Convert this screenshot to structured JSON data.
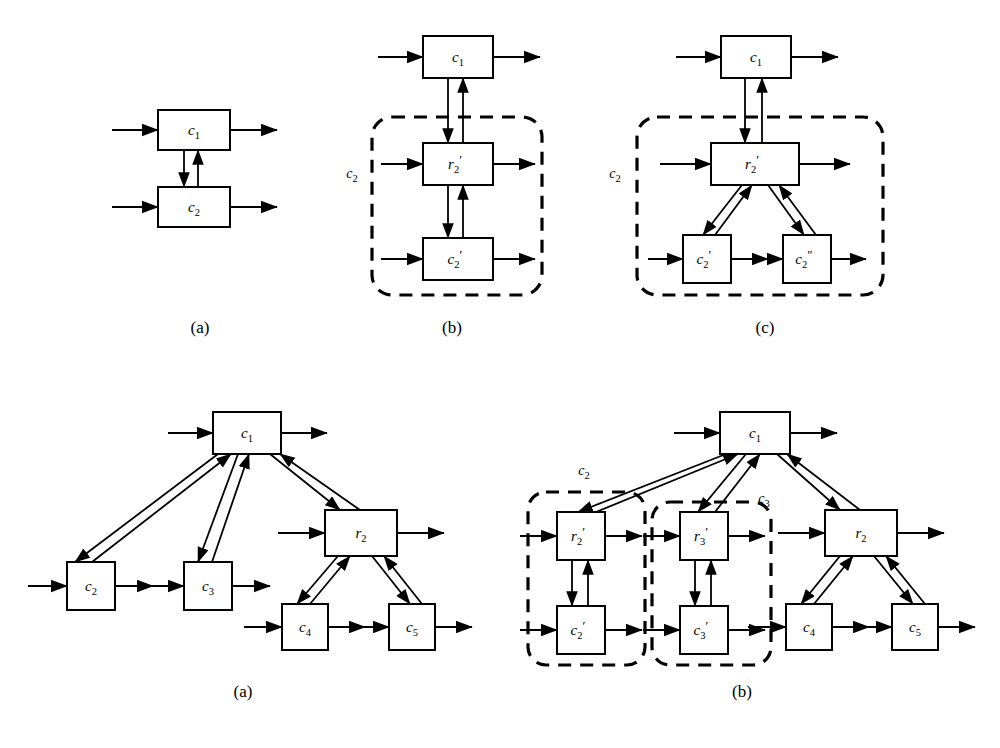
{
  "figure": {
    "background": "#ffffff",
    "ink": "#000000",
    "panels": [
      {
        "id": "top-a",
        "caption": "(a)",
        "caption_xy": [
          200,
          333
        ],
        "group_labels": [],
        "boxes": [
          {
            "name": "c1",
            "base": "c",
            "sub": "1",
            "prime": "",
            "x": 158,
            "y": 110,
            "w": 72,
            "h": 40
          },
          {
            "name": "c2",
            "base": "c",
            "sub": "2",
            "prime": "",
            "x": 158,
            "y": 187,
            "w": 72,
            "h": 40
          }
        ],
        "io_arrows": [
          {
            "kind": "in",
            "y": 130,
            "x1": 112,
            "x2": 158
          },
          {
            "kind": "out",
            "y": 130,
            "x1": 230,
            "x2": 277
          },
          {
            "kind": "in",
            "y": 207,
            "x1": 112,
            "x2": 158
          },
          {
            "kind": "out",
            "y": 207,
            "x1": 230,
            "x2": 277
          }
        ],
        "links": [
          {
            "from": "c1",
            "to": "c2",
            "x": 184,
            "y1": 150,
            "y2": 187,
            "dir": "down"
          },
          {
            "from": "c2",
            "to": "c1",
            "x": 198,
            "y1": 187,
            "y2": 150,
            "dir": "up"
          }
        ]
      },
      {
        "id": "top-b",
        "caption": "(b)",
        "caption_xy": [
          452,
          333
        ],
        "group_labels": [
          {
            "base": "c",
            "sub": "2",
            "prime": "",
            "x": 352,
            "y": 178
          }
        ],
        "dashed_boxes": [
          {
            "x": 372,
            "y": 117,
            "w": 170,
            "h": 178,
            "r": 20
          }
        ],
        "boxes": [
          {
            "name": "c1",
            "base": "c",
            "sub": "1",
            "prime": "",
            "x": 423,
            "y": 36,
            "w": 70,
            "h": 42
          },
          {
            "name": "r2p",
            "base": "r",
            "sub": "2",
            "prime": "′",
            "x": 423,
            "y": 143,
            "w": 70,
            "h": 42
          },
          {
            "name": "c2p",
            "base": "c",
            "sub": "2",
            "prime": "′",
            "x": 423,
            "y": 238,
            "w": 70,
            "h": 42
          }
        ],
        "io_arrows": [
          {
            "kind": "in",
            "y": 57,
            "x1": 378,
            "x2": 423
          },
          {
            "kind": "out",
            "y": 57,
            "x1": 493,
            "x2": 540
          },
          {
            "kind": "in",
            "y": 164,
            "x1": 381,
            "x2": 423
          },
          {
            "kind": "out",
            "y": 164,
            "x1": 493,
            "x2": 535
          },
          {
            "kind": "in",
            "y": 259,
            "x1": 381,
            "x2": 423
          },
          {
            "kind": "out",
            "y": 259,
            "x1": 493,
            "x2": 535
          }
        ],
        "links": [
          {
            "from": "c1",
            "to": "r2p",
            "x": 448,
            "y1": 78,
            "y2": 143,
            "dir": "down"
          },
          {
            "from": "r2p",
            "to": "c1",
            "x": 463,
            "y1": 143,
            "y2": 78,
            "dir": "up"
          },
          {
            "from": "r2p",
            "to": "c2p",
            "x": 448,
            "y1": 185,
            "y2": 238,
            "dir": "down"
          },
          {
            "from": "c2p",
            "to": "r2p",
            "x": 463,
            "y1": 238,
            "y2": 185,
            "dir": "up"
          }
        ]
      },
      {
        "id": "top-c",
        "caption": "(c)",
        "caption_xy": [
          765,
          333
        ],
        "group_labels": [
          {
            "base": "c",
            "sub": "2",
            "prime": "",
            "x": 615,
            "y": 178
          }
        ],
        "dashed_boxes": [
          {
            "x": 637,
            "y": 117,
            "w": 246,
            "h": 178,
            "r": 20
          }
        ],
        "boxes": [
          {
            "name": "c1",
            "base": "c",
            "sub": "1",
            "prime": "",
            "x": 721,
            "y": 36,
            "w": 70,
            "h": 42
          },
          {
            "name": "r2p",
            "base": "r",
            "sub": "2",
            "prime": "′",
            "x": 711,
            "y": 143,
            "w": 88,
            "h": 42
          },
          {
            "name": "c2p",
            "base": "c",
            "sub": "2",
            "prime": "′",
            "x": 683,
            "y": 235,
            "w": 48,
            "h": 48
          },
          {
            "name": "c2pp",
            "base": "c",
            "sub": "2",
            "prime": "″",
            "x": 783,
            "y": 235,
            "w": 48,
            "h": 48
          }
        ],
        "io_arrows": [
          {
            "kind": "in",
            "y": 57,
            "x1": 676,
            "x2": 721
          },
          {
            "kind": "out",
            "y": 57,
            "x1": 791,
            "x2": 838
          },
          {
            "kind": "in",
            "y": 164,
            "x1": 660,
            "x2": 711
          },
          {
            "kind": "out",
            "y": 164,
            "x1": 799,
            "x2": 850
          },
          {
            "kind": "in",
            "y": 259,
            "x1": 648,
            "x2": 683
          },
          {
            "kind": "out",
            "y": 259,
            "x1": 731,
            "x2": 768
          },
          {
            "kind": "in",
            "y": 259,
            "x1": 748,
            "x2": 783
          },
          {
            "kind": "out",
            "y": 259,
            "x1": 831,
            "x2": 866
          }
        ],
        "links": [
          {
            "from": "c1",
            "to": "r2p",
            "x": 745,
            "y1": 78,
            "y2": 143,
            "dir": "down"
          },
          {
            "from": "r2p",
            "to": "c1",
            "x": 762,
            "y1": 143,
            "y2": 78,
            "dir": "up"
          }
        ],
        "diag_links": [
          {
            "from": "r2p",
            "to": "c2p",
            "x1": 742,
            "y1": 185,
            "x2": 703,
            "y2": 235,
            "dir": "down"
          },
          {
            "from": "c2p",
            "to": "r2p",
            "x1": 715,
            "y1": 235,
            "x2": 752,
            "y2": 185,
            "dir": "up"
          },
          {
            "from": "r2p",
            "to": "c2pp",
            "x1": 768,
            "y1": 185,
            "x2": 804,
            "y2": 235,
            "dir": "down"
          },
          {
            "from": "c2pp",
            "to": "r2p",
            "x1": 816,
            "y1": 235,
            "x2": 779,
            "y2": 185,
            "dir": "up"
          }
        ]
      },
      {
        "id": "bot-a",
        "caption": "(a)",
        "caption_xy": [
          243,
          697
        ],
        "group_labels": [],
        "boxes": [
          {
            "name": "c1",
            "base": "c",
            "sub": "1",
            "prime": "",
            "x": 213,
            "y": 412,
            "w": 68,
            "h": 42
          },
          {
            "name": "c2",
            "base": "c",
            "sub": "2",
            "prime": "",
            "x": 67,
            "y": 562,
            "w": 48,
            "h": 48
          },
          {
            "name": "c3",
            "base": "c",
            "sub": "3",
            "prime": "",
            "x": 184,
            "y": 562,
            "w": 48,
            "h": 48
          },
          {
            "name": "r2",
            "base": "r",
            "sub": "2",
            "prime": "",
            "x": 325,
            "y": 510,
            "w": 72,
            "h": 46
          },
          {
            "name": "c4",
            "base": "c",
            "sub": "4",
            "prime": "",
            "x": 282,
            "y": 604,
            "w": 46,
            "h": 46
          },
          {
            "name": "c5",
            "base": "c",
            "sub": "5",
            "prime": "",
            "x": 389,
            "y": 604,
            "w": 46,
            "h": 46
          }
        ],
        "io_arrows": [
          {
            "kind": "in",
            "y": 433,
            "x1": 168,
            "x2": 213
          },
          {
            "kind": "out",
            "y": 433,
            "x1": 281,
            "x2": 327
          },
          {
            "kind": "in",
            "y": 586,
            "x1": 28,
            "x2": 67
          },
          {
            "kind": "out",
            "y": 586,
            "x1": 115,
            "x2": 153
          },
          {
            "kind": "in",
            "y": 586,
            "x1": 145,
            "x2": 184
          },
          {
            "kind": "out",
            "y": 586,
            "x1": 232,
            "x2": 270
          },
          {
            "kind": "in",
            "y": 533,
            "x1": 278,
            "x2": 325
          },
          {
            "kind": "out",
            "y": 533,
            "x1": 397,
            "x2": 444
          },
          {
            "kind": "in",
            "y": 627,
            "x1": 244,
            "x2": 282
          },
          {
            "kind": "out",
            "y": 627,
            "x1": 328,
            "x2": 365
          },
          {
            "kind": "in",
            "y": 627,
            "x1": 351,
            "x2": 389
          },
          {
            "kind": "out",
            "y": 627,
            "x1": 435,
            "x2": 472
          }
        ],
        "diag_links": [
          {
            "from": "c1",
            "to": "c2",
            "x1": 218,
            "y1": 454,
            "x2": 75,
            "y2": 562,
            "dir": "down"
          },
          {
            "from": "c2",
            "to": "c1",
            "x1": 92,
            "y1": 562,
            "x2": 231,
            "y2": 454,
            "dir": "up"
          },
          {
            "from": "c1",
            "to": "c3",
            "x1": 238,
            "y1": 454,
            "x2": 198,
            "y2": 562,
            "dir": "down"
          },
          {
            "from": "c3",
            "to": "c1",
            "x1": 212,
            "y1": 562,
            "x2": 249,
            "y2": 454,
            "dir": "up"
          },
          {
            "from": "c1",
            "to": "r2",
            "x1": 270,
            "y1": 454,
            "x2": 340,
            "y2": 510,
            "dir": "down"
          },
          {
            "from": "r2",
            "to": "c1",
            "x1": 360,
            "y1": 510,
            "x2": 280,
            "y2": 454,
            "dir": "up"
          },
          {
            "from": "r2",
            "to": "c4",
            "x1": 338,
            "y1": 556,
            "x2": 297,
            "y2": 604,
            "dir": "down"
          },
          {
            "from": "c4",
            "to": "r2",
            "x1": 310,
            "y1": 604,
            "x2": 350,
            "y2": 556,
            "dir": "up"
          },
          {
            "from": "r2",
            "to": "c5",
            "x1": 372,
            "y1": 556,
            "x2": 410,
            "y2": 604,
            "dir": "down"
          },
          {
            "from": "c5",
            "to": "r2",
            "x1": 422,
            "y1": 604,
            "x2": 384,
            "y2": 556,
            "dir": "up"
          }
        ]
      },
      {
        "id": "bot-b",
        "caption": "(b)",
        "caption_xy": [
          742,
          697
        ],
        "group_labels": [
          {
            "base": "c",
            "sub": "2",
            "prime": "",
            "x": 584,
            "y": 475
          },
          {
            "base": "c",
            "sub": "3",
            "prime": "",
            "x": 764,
            "y": 503
          }
        ],
        "dashed_boxes": [
          {
            "x": 528,
            "y": 492,
            "w": 117,
            "h": 173,
            "r": 18
          },
          {
            "x": 652,
            "y": 502,
            "w": 119,
            "h": 163,
            "r": 18
          }
        ],
        "boxes": [
          {
            "name": "c1",
            "base": "c",
            "sub": "1",
            "prime": "",
            "x": 720,
            "y": 412,
            "w": 70,
            "h": 42
          },
          {
            "name": "r2p",
            "base": "r",
            "sub": "2",
            "prime": "′",
            "x": 557,
            "y": 512,
            "w": 48,
            "h": 48
          },
          {
            "name": "c2p",
            "base": "c",
            "sub": "2",
            "prime": "′",
            "x": 557,
            "y": 606,
            "w": 48,
            "h": 48
          },
          {
            "name": "r3p",
            "base": "r",
            "sub": "3",
            "prime": "′",
            "x": 680,
            "y": 512,
            "w": 48,
            "h": 48
          },
          {
            "name": "c3p",
            "base": "c",
            "sub": "3",
            "prime": "′",
            "x": 680,
            "y": 606,
            "w": 48,
            "h": 48
          },
          {
            "name": "r2",
            "base": "r",
            "sub": "2",
            "prime": "",
            "x": 825,
            "y": 510,
            "w": 72,
            "h": 46
          },
          {
            "name": "c4",
            "base": "c",
            "sub": "4",
            "prime": "",
            "x": 786,
            "y": 604,
            "w": 46,
            "h": 46
          },
          {
            "name": "c5",
            "base": "c",
            "sub": "5",
            "prime": "",
            "x": 892,
            "y": 604,
            "w": 46,
            "h": 46
          }
        ],
        "io_arrows": [
          {
            "kind": "in",
            "y": 433,
            "x1": 674,
            "x2": 720
          },
          {
            "kind": "out",
            "y": 433,
            "x1": 790,
            "x2": 837
          },
          {
            "kind": "in",
            "y": 536,
            "x1": 520,
            "x2": 557
          },
          {
            "kind": "out",
            "y": 536,
            "x1": 605,
            "x2": 642
          },
          {
            "kind": "in",
            "y": 630,
            "x1": 520,
            "x2": 557
          },
          {
            "kind": "out",
            "y": 630,
            "x1": 605,
            "x2": 642
          },
          {
            "kind": "in",
            "y": 536,
            "x1": 643,
            "x2": 680
          },
          {
            "kind": "out",
            "y": 536,
            "x1": 728,
            "x2": 765
          },
          {
            "kind": "in",
            "y": 630,
            "x1": 643,
            "x2": 680
          },
          {
            "kind": "out",
            "y": 630,
            "x1": 728,
            "x2": 765
          },
          {
            "kind": "in",
            "y": 533,
            "x1": 778,
            "x2": 825
          },
          {
            "kind": "out",
            "y": 533,
            "x1": 897,
            "x2": 944
          },
          {
            "kind": "in",
            "y": 627,
            "x1": 748,
            "x2": 786
          },
          {
            "kind": "out",
            "y": 627,
            "x1": 832,
            "x2": 869
          },
          {
            "kind": "in",
            "y": 627,
            "x1": 855,
            "x2": 892
          },
          {
            "kind": "out",
            "y": 627,
            "x1": 938,
            "x2": 975
          }
        ],
        "links": [
          {
            "from": "r2p",
            "to": "c2p",
            "x": 572,
            "y1": 560,
            "y2": 606,
            "dir": "down"
          },
          {
            "from": "c2p",
            "to": "r2p",
            "x": 588,
            "y1": 606,
            "y2": 560,
            "dir": "up"
          },
          {
            "from": "r3p",
            "to": "c3p",
            "x": 695,
            "y1": 560,
            "y2": 606,
            "dir": "down"
          },
          {
            "from": "c3p",
            "to": "r3p",
            "x": 711,
            "y1": 606,
            "y2": 560,
            "dir": "up"
          }
        ],
        "diag_links": [
          {
            "from": "c1",
            "to": "r2p",
            "x1": 726,
            "y1": 454,
            "x2": 578,
            "y2": 512,
            "dir": "down"
          },
          {
            "from": "r2p",
            "to": "c1",
            "x1": 596,
            "y1": 512,
            "x2": 738,
            "y2": 454,
            "dir": "up"
          },
          {
            "from": "c1",
            "to": "r3p",
            "x1": 746,
            "y1": 454,
            "x2": 698,
            "y2": 512,
            "dir": "down"
          },
          {
            "from": "r3p",
            "to": "c1",
            "x1": 715,
            "y1": 512,
            "x2": 760,
            "y2": 454,
            "dir": "up"
          },
          {
            "from": "c1",
            "to": "r2",
            "x1": 777,
            "y1": 454,
            "x2": 840,
            "y2": 510,
            "dir": "down"
          },
          {
            "from": "r2",
            "to": "c1",
            "x1": 860,
            "y1": 510,
            "x2": 787,
            "y2": 454,
            "dir": "up"
          },
          {
            "from": "r2",
            "to": "c4",
            "x1": 840,
            "y1": 556,
            "x2": 801,
            "y2": 604,
            "dir": "down"
          },
          {
            "from": "c4",
            "to": "r2",
            "x1": 814,
            "y1": 604,
            "x2": 853,
            "y2": 556,
            "dir": "up"
          },
          {
            "from": "r2",
            "to": "c5",
            "x1": 874,
            "y1": 556,
            "x2": 913,
            "y2": 604,
            "dir": "down"
          },
          {
            "from": "c5",
            "to": "r2",
            "x1": 925,
            "y1": 604,
            "x2": 886,
            "y2": 556,
            "dir": "up"
          }
        ]
      }
    ]
  }
}
